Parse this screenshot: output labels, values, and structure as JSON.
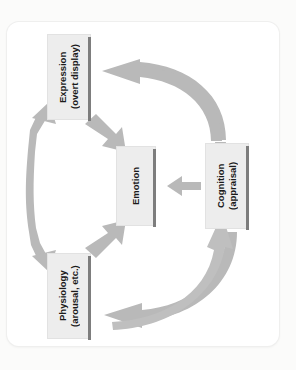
{
  "diagram": {
    "orientation": "rotated-90-clockwise",
    "frame": {
      "shape": "rounded-rectangle",
      "color": "#ffffff"
    },
    "nodes": [
      {
        "id": "expression",
        "label": "Expression\n(overt display)",
        "line1": "Expression",
        "line2": "(overt display)",
        "fill": "#ededed",
        "shadow": "#7d7d7d"
      },
      {
        "id": "cognition",
        "label": "Cognition\n(appraisal)",
        "line1": "Cognition",
        "line2": "(appraisal)",
        "fill": "#ededed",
        "shadow": "#7d7d7d"
      },
      {
        "id": "physiology",
        "label": "Physiology\n(arousal, etc.)",
        "line1": "Physiology",
        "line2": "(arousal, etc.)",
        "fill": "#ededed",
        "shadow": "#7d7d7d"
      },
      {
        "id": "emotion",
        "label": "Emotion",
        "line1": "Emotion",
        "line2": "",
        "fill": "#ededed",
        "shadow": "#7d7d7d"
      }
    ],
    "arrows": [
      {
        "id": "cognition-to-emotion",
        "from": "cognition",
        "to": "emotion",
        "style": "straight",
        "heads": "single",
        "color": "#b9b9b9"
      },
      {
        "id": "cognition-to-expression",
        "from": "cognition",
        "to": "expression",
        "style": "curved",
        "heads": "single",
        "color": "#b9b9b9"
      },
      {
        "id": "physiology-to-cognition",
        "from": "physiology",
        "to": "cognition",
        "style": "curved",
        "heads": "single",
        "color": "#b9b9b9"
      },
      {
        "id": "cognition-to-physiology",
        "from": "cognition",
        "to": "physiology",
        "style": "curved",
        "heads": "single",
        "color": "#b9b9b9"
      },
      {
        "id": "expression-to-emotion",
        "from": "expression",
        "to": "emotion",
        "style": "diagonal",
        "heads": "single",
        "color": "#b9b9b9"
      },
      {
        "id": "physiology-to-emotion",
        "from": "physiology",
        "to": "emotion",
        "style": "diagonal",
        "heads": "single",
        "color": "#b9b9b9"
      },
      {
        "id": "expression-physiology",
        "from": "expression",
        "to": "physiology",
        "style": "curved-double",
        "heads": "double",
        "color": "#b9b9b9"
      }
    ]
  }
}
